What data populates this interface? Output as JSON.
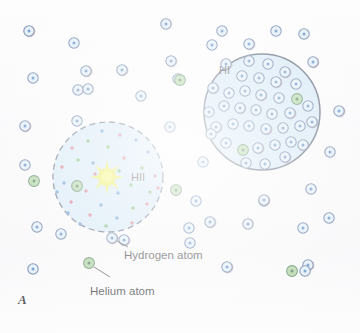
{
  "figure": {
    "panel_letter": "A",
    "width": 360,
    "height": 333,
    "background_color": "#fbfbfc"
  },
  "regions": [
    {
      "id": "hii",
      "label": "HII",
      "label_x": 131,
      "label_y": 171,
      "cx": 108,
      "cy": 177,
      "r": 55,
      "fill_color": "#c6e0f2",
      "stroke_color": "#3b4a63",
      "border_style": "dashed",
      "description": "ionized hydrogen region surrounding a hot star"
    },
    {
      "id": "hi",
      "label": "HI",
      "label_x": 219,
      "label_y": 64,
      "cx": 262,
      "cy": 112,
      "r": 58,
      "fill_color": "#c6e0f2",
      "stroke_color": "#2f3c52",
      "border_style": "solid",
      "description": "neutral atomic hydrogen cloud"
    }
  ],
  "star": {
    "name": "hot-star",
    "cx": 107,
    "cy": 177,
    "core_r": 5.5,
    "ray_count": 16,
    "ray_length_long": 17,
    "ray_length_short": 10,
    "color": "#e8e81f",
    "core_color": "#f4f45a"
  },
  "legend": {
    "items": [
      {
        "name": "hydrogen-atom",
        "label": "Hydrogen atom",
        "label_x": 124,
        "label_y": 249,
        "marker_x": 112,
        "marker_y": 238,
        "leader": {
          "x1": 117,
          "y1": 241,
          "x2": 128,
          "y2": 247
        },
        "ring_color": "#3a5a8c",
        "fill_color": "#cfe4f5",
        "nucleus_color": "#2f6fb5"
      },
      {
        "name": "helium-atom",
        "label": "Helium atom",
        "label_x": 90,
        "label_y": 285,
        "marker_x": 89,
        "marker_y": 263,
        "leader": {
          "x1": 94,
          "y1": 267,
          "x2": 110,
          "y2": 277
        },
        "ring_color": "#2f6b3a",
        "fill_color": "#9cc98a",
        "nucleus_color": "#1f5c2c"
      }
    ]
  },
  "atom_styles": {
    "hydrogen": {
      "ring_color": "#3a5a8c",
      "ring_alt_color": "#8c4a52",
      "fill_color": "#dbeaf7",
      "nucleus_color": "#2f6fb5",
      "radius": 5.2
    },
    "helium": {
      "ring_color": "#2f6b3a",
      "fill_color": "#9cc98a",
      "nucleus_color": "#1f5c2c",
      "radius": 5.4
    }
  },
  "ion_styles": {
    "proton": {
      "color": "#c9556b",
      "radius": 1.7
    },
    "electron": {
      "color": "#3d7fc4",
      "radius": 1.7
    },
    "helium_ion": {
      "color": "#5aa84a",
      "radius": 1.8
    }
  },
  "background_atoms": [
    {
      "type": "hydrogen",
      "x": 29,
      "y": 31
    },
    {
      "type": "hydrogen",
      "x": 74,
      "y": 43
    },
    {
      "type": "hydrogen",
      "x": 33,
      "y": 78
    },
    {
      "type": "hydrogen",
      "x": 86,
      "y": 71
    },
    {
      "type": "hydrogen",
      "x": 78,
      "y": 90
    },
    {
      "type": "hydrogen",
      "x": 88,
      "y": 89
    },
    {
      "type": "hydrogen",
      "x": 122,
      "y": 70
    },
    {
      "type": "hydrogen",
      "x": 141,
      "y": 96
    },
    {
      "type": "hydrogen",
      "x": 166,
      "y": 24
    },
    {
      "type": "hydrogen",
      "x": 171,
      "y": 61
    },
    {
      "type": "hydrogen",
      "x": 178,
      "y": 79
    },
    {
      "type": "helium",
      "x": 180,
      "y": 80
    },
    {
      "type": "hydrogen",
      "x": 25,
      "y": 126
    },
    {
      "type": "hydrogen",
      "x": 77,
      "y": 121
    },
    {
      "type": "hydrogen",
      "x": 25,
      "y": 165
    },
    {
      "type": "helium",
      "x": 34,
      "y": 181
    },
    {
      "type": "hydrogen",
      "x": 170,
      "y": 127
    },
    {
      "type": "hydrogen",
      "x": 203,
      "y": 162
    },
    {
      "type": "helium",
      "x": 176,
      "y": 190
    },
    {
      "type": "hydrogen",
      "x": 37,
      "y": 227
    },
    {
      "type": "hydrogen",
      "x": 61,
      "y": 234
    },
    {
      "type": "hydrogen",
      "x": 124,
      "y": 240
    },
    {
      "type": "hydrogen",
      "x": 189,
      "y": 228
    },
    {
      "type": "hydrogen",
      "x": 190,
      "y": 243
    },
    {
      "type": "hydrogen",
      "x": 210,
      "y": 222
    },
    {
      "type": "hydrogen",
      "x": 248,
      "y": 224
    },
    {
      "type": "hydrogen",
      "x": 264,
      "y": 201
    },
    {
      "type": "hydrogen",
      "x": 227,
      "y": 267
    },
    {
      "type": "hydrogen",
      "x": 33,
      "y": 269
    },
    {
      "type": "helium",
      "x": 89,
      "y": 263
    },
    {
      "type": "hydrogen",
      "x": 112,
      "y": 238
    },
    {
      "type": "hydrogen",
      "x": 222,
      "y": 31
    },
    {
      "type": "helium",
      "x": 292,
      "y": 271
    },
    {
      "type": "hydrogen",
      "x": 308,
      "y": 265
    },
    {
      "type": "hydrogen",
      "x": 305,
      "y": 271
    },
    {
      "type": "hydrogen",
      "x": 212,
      "y": 45
    },
    {
      "type": "hydrogen",
      "x": 249,
      "y": 44
    },
    {
      "type": "hydrogen",
      "x": 276,
      "y": 31
    },
    {
      "type": "hydrogen",
      "x": 304,
      "y": 34
    },
    {
      "type": "hydrogen",
      "x": 313,
      "y": 62
    },
    {
      "type": "hydrogen",
      "x": 330,
      "y": 152
    },
    {
      "type": "hydrogen",
      "x": 311,
      "y": 189
    },
    {
      "type": "hydrogen",
      "x": 264,
      "y": 200
    },
    {
      "type": "hydrogen",
      "x": 329,
      "y": 218
    },
    {
      "type": "hydrogen",
      "x": 303,
      "y": 228
    },
    {
      "type": "hydrogen",
      "x": 339,
      "y": 111
    },
    {
      "type": "hydrogen",
      "x": 196,
      "y": 201
    }
  ],
  "hi_region_atoms": [
    {
      "type": "hydrogen",
      "x": 226,
      "y": 64
    },
    {
      "type": "hydrogen",
      "x": 249,
      "y": 61
    },
    {
      "type": "hydrogen",
      "x": 268,
      "y": 64
    },
    {
      "type": "hydrogen",
      "x": 285,
      "y": 72
    },
    {
      "type": "hydrogen",
      "x": 242,
      "y": 76
    },
    {
      "type": "hydrogen",
      "x": 259,
      "y": 78
    },
    {
      "type": "hydrogen",
      "x": 276,
      "y": 82
    },
    {
      "type": "hydrogen",
      "x": 296,
      "y": 84
    },
    {
      "type": "helium",
      "x": 297,
      "y": 99
    },
    {
      "type": "hydrogen",
      "x": 213,
      "y": 88
    },
    {
      "type": "hydrogen",
      "x": 229,
      "y": 93
    },
    {
      "type": "hydrogen",
      "x": 245,
      "y": 91
    },
    {
      "type": "hydrogen",
      "x": 261,
      "y": 95
    },
    {
      "type": "hydrogen",
      "x": 279,
      "y": 98
    },
    {
      "type": "hydrogen",
      "x": 224,
      "y": 106
    },
    {
      "type": "hydrogen",
      "x": 240,
      "y": 108
    },
    {
      "type": "hydrogen",
      "x": 256,
      "y": 110
    },
    {
      "type": "hydrogen",
      "x": 272,
      "y": 114
    },
    {
      "type": "hydrogen",
      "x": 290,
      "y": 113
    },
    {
      "type": "hydrogen",
      "x": 308,
      "y": 106
    },
    {
      "type": "hydrogen",
      "x": 209,
      "y": 112
    },
    {
      "type": "hydrogen",
      "x": 216,
      "y": 127
    },
    {
      "type": "hydrogen",
      "x": 233,
      "y": 124
    },
    {
      "type": "hydrogen",
      "x": 249,
      "y": 126
    },
    {
      "type": "hydrogen",
      "x": 266,
      "y": 129
    },
    {
      "type": "hydrogen",
      "x": 283,
      "y": 128
    },
    {
      "type": "hydrogen",
      "x": 300,
      "y": 126
    },
    {
      "type": "hydrogen",
      "x": 312,
      "y": 122
    },
    {
      "type": "helium",
      "x": 243,
      "y": 150
    },
    {
      "type": "hydrogen",
      "x": 226,
      "y": 143
    },
    {
      "type": "hydrogen",
      "x": 258,
      "y": 148
    },
    {
      "type": "hydrogen",
      "x": 275,
      "y": 145
    },
    {
      "type": "hydrogen",
      "x": 291,
      "y": 142
    },
    {
      "type": "hydrogen",
      "x": 303,
      "y": 145
    },
    {
      "type": "hydrogen",
      "x": 246,
      "y": 163
    },
    {
      "type": "hydrogen",
      "x": 265,
      "y": 164
    },
    {
      "type": "hydrogen",
      "x": 285,
      "y": 157
    },
    {
      "type": "hydrogen",
      "x": 211,
      "y": 134
    }
  ],
  "hii_region_particles": [
    {
      "type": "electron",
      "x": 102,
      "y": 131
    },
    {
      "type": "proton",
      "x": 120,
      "y": 135
    },
    {
      "type": "helium_ion",
      "x": 88,
      "y": 141
    },
    {
      "type": "electron",
      "x": 136,
      "y": 140
    },
    {
      "type": "proton",
      "x": 72,
      "y": 148
    },
    {
      "type": "helium_ion",
      "x": 108,
      "y": 147
    },
    {
      "type": "electron",
      "x": 148,
      "y": 152
    },
    {
      "type": "helium_ion",
      "x": 78,
      "y": 160
    },
    {
      "type": "proton",
      "x": 124,
      "y": 158
    },
    {
      "type": "proton",
      "x": 62,
      "y": 167
    },
    {
      "type": "electron",
      "x": 93,
      "y": 163
    },
    {
      "type": "helium_ion",
      "x": 142,
      "y": 168
    },
    {
      "type": "proton",
      "x": 155,
      "y": 176
    },
    {
      "type": "electron",
      "x": 64,
      "y": 183
    },
    {
      "type": "helium_ion",
      "x": 131,
      "y": 185
    },
    {
      "type": "proton",
      "x": 86,
      "y": 191
    },
    {
      "type": "electron",
      "x": 118,
      "y": 193
    },
    {
      "type": "helium_ion",
      "x": 150,
      "y": 192
    },
    {
      "type": "proton",
      "x": 71,
      "y": 202
    },
    {
      "type": "electron",
      "x": 101,
      "y": 205
    },
    {
      "type": "helium_ion",
      "x": 133,
      "y": 208
    },
    {
      "type": "proton",
      "x": 90,
      "y": 215
    },
    {
      "type": "electron",
      "x": 117,
      "y": 218
    },
    {
      "type": "proton",
      "x": 147,
      "y": 204
    },
    {
      "type": "electron",
      "x": 80,
      "y": 224
    },
    {
      "type": "helium_ion",
      "x": 106,
      "y": 226
    },
    {
      "type": "proton",
      "x": 132,
      "y": 223
    },
    {
      "type": "electron",
      "x": 57,
      "y": 192
    },
    {
      "type": "proton",
      "x": 95,
      "y": 174
    },
    {
      "type": "helium_ion",
      "x": 119,
      "y": 171
    },
    {
      "type": "electron",
      "x": 68,
      "y": 213
    },
    {
      "type": "proton",
      "x": 158,
      "y": 188
    }
  ],
  "hii_region_atoms": [
    {
      "type": "helium",
      "x": 77,
      "y": 186
    }
  ]
}
